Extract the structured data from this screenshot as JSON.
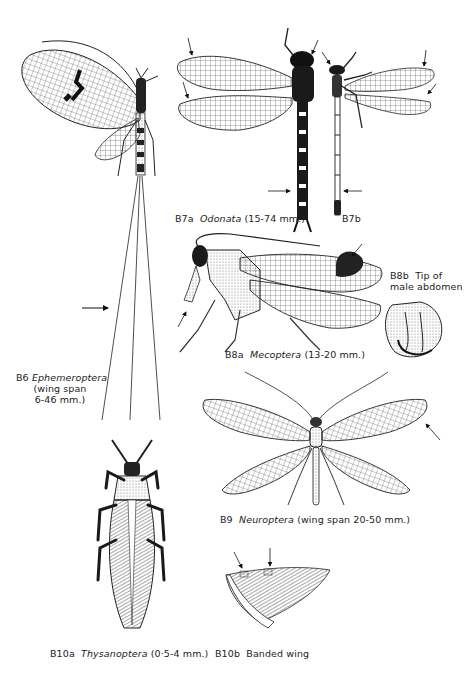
{
  "plate": {
    "figures": [
      {
        "id": "B6",
        "code": "B6",
        "order": "Ephemeroptera",
        "note_line1": "(wing span",
        "note_line2": "6-46 mm.)"
      },
      {
        "id": "B7a",
        "code": "B7a",
        "order": "Odonata",
        "size": "(15-74 mm.)"
      },
      {
        "id": "B7b",
        "code": "B7b"
      },
      {
        "id": "B8a",
        "code": "B8a",
        "order": "Mecoptera",
        "size": "(13-20 mm.)"
      },
      {
        "id": "B8b",
        "code": "B8b",
        "caption_line1": "Tip of",
        "caption_line2": "male abdomen"
      },
      {
        "id": "B9",
        "code": "B9",
        "order": "Neuroptera",
        "size": "(wing span 20-50 mm.)"
      },
      {
        "id": "B10a",
        "code": "B10a",
        "order": "Thysanoptera",
        "size": "(0·5-4 mm.)"
      },
      {
        "id": "B10b",
        "code": "B10b",
        "caption": "Banded wing"
      }
    ],
    "colors": {
      "ink": "#1a1a1a",
      "paper": "#ffffff",
      "shade": "#8a8a8a"
    }
  }
}
